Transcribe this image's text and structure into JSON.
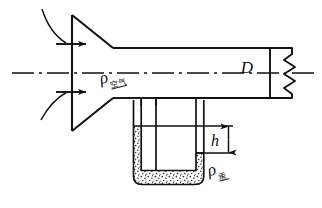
{
  "figure": {
    "kind": "engineering-schematic",
    "background_color": "#ffffff",
    "line_color": "#111111"
  },
  "labels": {
    "pipe_diameter": "D",
    "manometer_height": "h",
    "rho_symbol": "ρ",
    "air_subscript": "空气",
    "mercury_subscript": "汞"
  },
  "components": {
    "bellmouth_name": "bell-mouth-inlet",
    "pipe_name": "horizontal-pipe",
    "centerline_name": "axis-centerline",
    "manometer_name": "u-tube-manometer",
    "mercury_name": "mercury-fill",
    "break_name": "pipe-break-symbol",
    "inlet_arrow_upper": "inlet-flow-arrow-upper",
    "inlet_arrow_lower": "inlet-flow-arrow-lower",
    "streamline_upper": "inlet-streamline-upper",
    "streamline_lower": "inlet-streamline-lower",
    "dimension_h": "h-dimension-line"
  },
  "geometry": {
    "centerline_y": 73,
    "pipe_top_y": 48,
    "pipe_bottom_y": 98,
    "pipe_right_x": 270,
    "cone_face_x": 72,
    "cone_top_y": 15,
    "cone_bottom_y": 131,
    "cone_throat_x": 113,
    "tube_left_x": 141,
    "tube_right_x": 156,
    "utube_outer_left_x": 133,
    "utube_outer_right_x": 204,
    "utube_bottom_y": 185,
    "mercury_left_level_y": 126,
    "mercury_right_level_y": 153,
    "h_dim_x": 228
  }
}
